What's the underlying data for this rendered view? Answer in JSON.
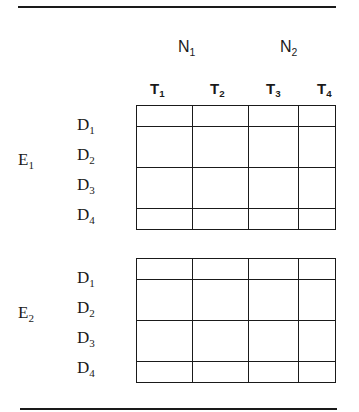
{
  "diagram": {
    "type": "design-matrix",
    "groups": [
      {
        "label": "N",
        "sub": "1",
        "spans": [
          "T1",
          "T2"
        ]
      },
      {
        "label": "N",
        "sub": "2",
        "spans": [
          "T3",
          "T4"
        ]
      }
    ],
    "columns": [
      {
        "label": "T",
        "sub": "1"
      },
      {
        "label": "T",
        "sub": "2"
      },
      {
        "label": "T",
        "sub": "3"
      },
      {
        "label": "T",
        "sub": "4"
      }
    ],
    "blocks": [
      {
        "label": "E",
        "sub": "1",
        "rows": [
          {
            "label": "D",
            "sub": "1"
          },
          {
            "label": "D",
            "sub": "2"
          },
          {
            "label": "D",
            "sub": "3"
          },
          {
            "label": "D",
            "sub": "4"
          }
        ]
      },
      {
        "label": "E",
        "sub": "2",
        "rows": [
          {
            "label": "D",
            "sub": "1"
          },
          {
            "label": "D",
            "sub": "2"
          },
          {
            "label": "D",
            "sub": "3"
          },
          {
            "label": "D",
            "sub": "4"
          }
        ]
      }
    ],
    "cells_filled": false
  }
}
